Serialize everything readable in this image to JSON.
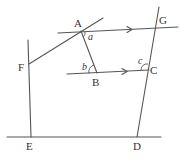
{
  "diagram": {
    "type": "geometry",
    "points": {
      "A": {
        "label": "A",
        "x": 81,
        "y": 31
      },
      "B": {
        "label": "B",
        "x": 97,
        "y": 72
      },
      "C": {
        "label": "C",
        "x": 148,
        "y": 70
      },
      "D": {
        "label": "D",
        "x": 137,
        "y": 137
      },
      "E": {
        "label": "E",
        "x": 31,
        "y": 137
      },
      "F": {
        "label": "F",
        "x": 29,
        "y": 64
      },
      "G": {
        "label": "G",
        "x": 156,
        "y": 28
      }
    },
    "angles": {
      "a": {
        "label": "a",
        "at": "A"
      },
      "b": {
        "label": "b",
        "at": "B"
      },
      "c": {
        "label": "c",
        "at": "C"
      }
    },
    "parallel_marker": "arrow",
    "colors": {
      "line": "#555555",
      "text": "#333333",
      "background": "#ffffff"
    }
  }
}
